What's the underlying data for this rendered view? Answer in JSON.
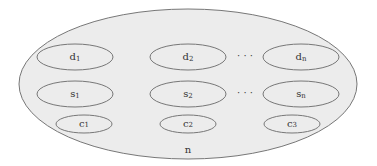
{
  "diagram": {
    "colors": {
      "fill": "#ececec",
      "stroke": "#777777",
      "text": "#333333",
      "background": "#ffffff"
    },
    "outer": {
      "label": "n"
    },
    "rows": [
      {
        "name": "d",
        "items": [
          {
            "base": "d",
            "sub": "1"
          },
          {
            "base": "d",
            "sub": "2"
          },
          {
            "base": "d",
            "sub": "n"
          }
        ],
        "ellipsis": "· · ·"
      },
      {
        "name": "s",
        "items": [
          {
            "base": "s",
            "sub": "1"
          },
          {
            "base": "s",
            "sub": "2"
          },
          {
            "base": "s",
            "sub": "n"
          }
        ],
        "ellipsis": "· · ·"
      },
      {
        "name": "c",
        "items": [
          {
            "base": "c",
            "sub": "1"
          },
          {
            "base": "c",
            "sub": "2"
          },
          {
            "base": "c",
            "sub": "3"
          }
        ]
      }
    ]
  }
}
